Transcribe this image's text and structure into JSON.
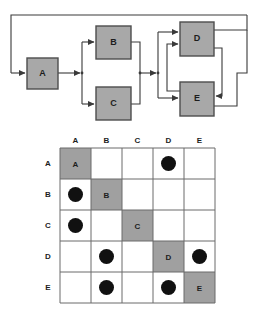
{
  "colors": {
    "node_fill": "#a8a8a8",
    "node_stroke": "#4d4d4d",
    "diag_fill": "#a0a0a0",
    "cell_fill": "#ffffff",
    "grid_stroke": "#6b6b6b",
    "line": "#3a3a3a",
    "mark": "#111111",
    "text": "#1d1d1d",
    "background": "#ffffff"
  },
  "diagram": {
    "type": "block-flow-diagram",
    "nodes": [
      {
        "id": "A",
        "label": "A",
        "x": 27,
        "y": 58,
        "w": 31,
        "h": 31
      },
      {
        "id": "B",
        "label": "B",
        "x": 96,
        "y": 26,
        "w": 35,
        "h": 33
      },
      {
        "id": "C",
        "label": "C",
        "x": 96,
        "y": 87,
        "w": 35,
        "h": 33
      },
      {
        "id": "D",
        "label": "D",
        "x": 180,
        "y": 22,
        "w": 34,
        "h": 34
      },
      {
        "id": "E",
        "label": "E",
        "x": 180,
        "y": 82,
        "w": 34,
        "h": 34
      }
    ],
    "edges": [
      {
        "from": "A",
        "to": "B"
      },
      {
        "from": "A",
        "to": "C"
      },
      {
        "from": "B",
        "to": "D"
      },
      {
        "from": "B",
        "to": "E"
      },
      {
        "from": "C",
        "to": "D"
      },
      {
        "from": "C",
        "to": "E"
      },
      {
        "from": "D",
        "to": "E"
      },
      {
        "from": "E",
        "to": "D"
      },
      {
        "from": "D",
        "to": "A"
      },
      {
        "from": "E",
        "to": "A"
      }
    ]
  },
  "matrix": {
    "type": "design-structure-matrix",
    "row_labels": [
      "A",
      "B",
      "C",
      "D",
      "E"
    ],
    "column_labels": [
      "A",
      "B",
      "C",
      "D",
      "E"
    ],
    "diagonal_labels": [
      "A",
      "B",
      "C",
      "D",
      "E"
    ],
    "mark_glyph": "filled-circle",
    "cells": [
      [
        "diagonal",
        "empty",
        "empty",
        "mark",
        "empty"
      ],
      [
        "mark",
        "diagonal",
        "empty",
        "empty",
        "empty"
      ],
      [
        "mark",
        "empty",
        "diagonal",
        "empty",
        "empty"
      ],
      [
        "empty",
        "mark",
        "empty",
        "diagonal",
        "mark"
      ],
      [
        "empty",
        "mark",
        "empty",
        "mark",
        "diagonal"
      ]
    ],
    "geometry": {
      "grid_x": 60,
      "grid_y": 18,
      "cell_w": 31,
      "cell_h": 31,
      "header_row_y": 10,
      "header_col_x": 48
    }
  }
}
